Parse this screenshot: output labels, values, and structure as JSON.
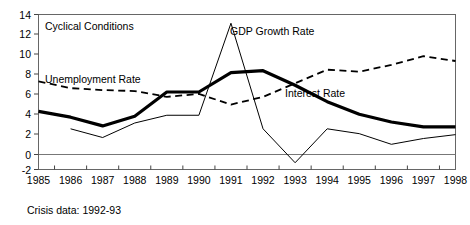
{
  "chart_data": {
    "type": "line",
    "title": "",
    "xlabel": "",
    "ylabel": "",
    "x": [
      1985,
      1986,
      1987,
      1988,
      1989,
      1990,
      1991,
      1992,
      1993,
      1994,
      1995,
      1996,
      1997,
      1998
    ],
    "categories": [
      "1985",
      "1986",
      "1987",
      "1988",
      "1989",
      "1990",
      "1991",
      "1992",
      "1993",
      "1994",
      "1995",
      "1996",
      "1997",
      "1998"
    ],
    "xlim": [
      1985,
      1998
    ],
    "ylim": [
      -2,
      14
    ],
    "ytick_labels": [
      "14",
      "12",
      "10",
      "8",
      "6",
      "4",
      "2",
      "0",
      "-2"
    ],
    "ytick_values": [
      14,
      12,
      10,
      8,
      6,
      4,
      2,
      0,
      -2
    ],
    "grid": false,
    "legend_position": "inline-annotations",
    "zero_line": true,
    "series": [
      {
        "name": "Interest Rate",
        "style": "thick-solid",
        "color": "#000000",
        "values": [
          4.0,
          3.4,
          2.5,
          3.5,
          6.0,
          6.0,
          8.0,
          8.2,
          6.7,
          5.0,
          3.7,
          2.9,
          2.4,
          2.4
        ]
      },
      {
        "name": "GDP Growth Rate",
        "style": "thin-solid",
        "color": "#000000",
        "values": [
          null,
          2.2,
          1.3,
          2.8,
          3.6,
          3.6,
          13.1,
          2.2,
          -1.3,
          2.2,
          1.7,
          0.6,
          1.2,
          1.6
        ]
      },
      {
        "name": "Unemployment Rate",
        "style": "dashed",
        "color": "#000000",
        "values": [
          7.1,
          6.4,
          6.2,
          6.1,
          5.5,
          5.8,
          4.7,
          5.5,
          6.9,
          8.3,
          8.1,
          8.8,
          9.7,
          9.2
        ]
      }
    ],
    "annotations": [
      {
        "id": "cyclical-conditions",
        "text": "Cyclical Conditions",
        "x_px": 45,
        "y_px": 30
      },
      {
        "id": "unemployment-rate",
        "text": "Unemployment Rate",
        "x_px": 45,
        "y_px": 83
      },
      {
        "id": "gdp-growth-rate",
        "text": "GDP Growth Rate",
        "x_px": 230,
        "y_px": 35
      },
      {
        "id": "interest-rate",
        "text": "Interest Rate",
        "x_px": 285,
        "y_px": 97
      }
    ],
    "caption": "Crisis data: 1992-93"
  }
}
